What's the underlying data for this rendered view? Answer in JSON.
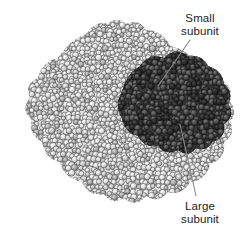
{
  "figure": {
    "background_color": "#ffffff",
    "subunits": [
      {
        "id": "large-subunit",
        "label_line1": "Large",
        "label_line2": "subunit",
        "shade": "light gray",
        "color": "#d8d8d8",
        "outline_color": "#5a5a5a",
        "description": "Light gray sphere-packed body forming the bulk of the diamond shaped particle"
      },
      {
        "id": "small-subunit",
        "label_line1": "Small",
        "label_line2": "subunit",
        "shade": "dark gray",
        "color": "#4a4a4a",
        "dark_color": "#2a2a2a",
        "outline_color": "#1a1a1a",
        "description": "Dark gray sphere-packed lobe occupying the upper right region"
      }
    ],
    "labels": {
      "small": {
        "line1": "Small",
        "line2": "subunit",
        "text_color": "#1c1c1c",
        "leader_from_x": 190,
        "leader_from_y": 40,
        "leader_to_x": 158,
        "leader_to_y": 86
      },
      "large": {
        "line1": "Large",
        "line2": "subunit",
        "text_color": "#1c1c1c",
        "leader_from_x": 196,
        "leader_from_y": 196,
        "leader_to_x": 180,
        "leader_to_y": 124
      }
    },
    "leader_line_color": "#8a8a8a"
  }
}
